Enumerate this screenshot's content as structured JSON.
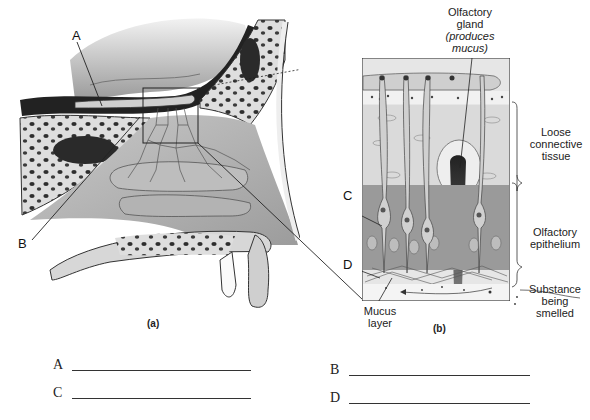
{
  "diagram": {
    "panel_a": {
      "caption": "(a)",
      "labels": {
        "A": "A",
        "B": "B"
      }
    },
    "panel_b": {
      "caption": "(b)",
      "labels": {
        "C": "C",
        "D": "D",
        "olfactory_gland_line1": "Olfactory",
        "olfactory_gland_line2": "gland",
        "olfactory_gland_line3": "(produces",
        "olfactory_gland_line4": "mucus)",
        "loose_connective_line1": "Loose",
        "loose_connective_line2": "connective",
        "loose_connective_line3": "tissue",
        "olfactory_epithelium_line1": "Olfactory",
        "olfactory_epithelium_line2": "epithelium",
        "substance_line1": "Substance",
        "substance_line2": "being",
        "substance_line3": "smelled",
        "mucus_line1": "Mucus",
        "mucus_line2": "layer"
      }
    }
  },
  "answers": [
    {
      "letter": "A",
      "value": ""
    },
    {
      "letter": "B",
      "value": ""
    },
    {
      "letter": "C",
      "value": ""
    },
    {
      "letter": "D",
      "value": ""
    }
  ],
  "colors": {
    "bone": "#d8d8d8",
    "bone_dark": "#3a3a3a",
    "tissue_light": "#dcdcdc",
    "tissue_mid": "#a9a9a9",
    "epithelium": "#8f8f8f",
    "line": "#222222"
  }
}
